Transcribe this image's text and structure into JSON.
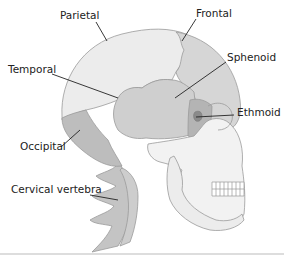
{
  "diagram": {
    "labels": {
      "parietal": "Parietal",
      "frontal": "Frontal",
      "temporal": "Temporal",
      "sphenoid": "Sphenoid",
      "ethmoid": "Ethmoid",
      "occipital": "Occipital",
      "cervical_vertebra": "Cervical vertebra"
    },
    "colors": {
      "parietal": "#ececec",
      "frontal": "#d6d6d6",
      "temporal": "#cfcfcf",
      "sphenoid": "#b4b4b4",
      "ethmoid": "#8a8a8a",
      "occipital": "#bdbdbd",
      "face": "#f2f2f2",
      "vertebrae": "#c4c4c4",
      "label_text": "#222222",
      "outline": "#9a9a9a"
    }
  }
}
